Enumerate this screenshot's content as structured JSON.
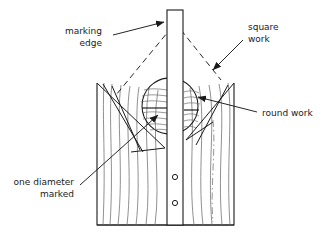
{
  "diagram": {
    "background_color": "#ffffff",
    "line_color": "#1a1a1a",
    "grain_color": "#5a5a5a",
    "labels": {
      "marking_edge": {
        "line1": "marking",
        "line2": "edge"
      },
      "square_work": {
        "line1": "square",
        "line2": "work"
      },
      "round_work": {
        "line1": "round work"
      },
      "one_diameter_marked": {
        "line1": "one diameter",
        "line2": "marked"
      }
    },
    "parts": {
      "straightedge": "marking-edge-rule",
      "workpiece": "wood-block",
      "round_stock": "round-work-circle",
      "holes_count": "2"
    }
  }
}
